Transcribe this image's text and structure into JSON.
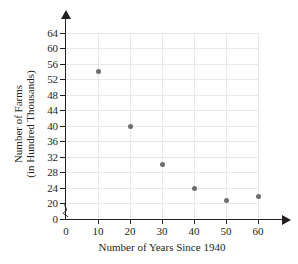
{
  "chart_data": {
    "type": "scatter",
    "title": "",
    "xlabel": "Number of Years Since 1940",
    "ylabel_line1": "Number of Farms",
    "ylabel_line2": "(in Hundred Thousands)",
    "x": [
      10,
      20,
      30,
      40,
      50,
      60
    ],
    "values": [
      54,
      39.8,
      30,
      23.8,
      20.7,
      21.7
    ],
    "points": [
      {
        "x": 10,
        "y": 54
      },
      {
        "x": 20,
        "y": 39.8
      },
      {
        "x": 30,
        "y": 30
      },
      {
        "x": 40,
        "y": 23.8
      },
      {
        "x": 50,
        "y": 20.7
      },
      {
        "x": 60,
        "y": 21.7
      }
    ],
    "xticks": [
      0,
      10,
      20,
      30,
      40,
      50,
      60
    ],
    "yticks": [
      0,
      20,
      24,
      28,
      32,
      36,
      40,
      44,
      48,
      52,
      56,
      60,
      64
    ],
    "xlim": [
      0,
      60
    ],
    "ylim": [
      20,
      64
    ],
    "y_axis_break": true,
    "y_axis_break_between": [
      0,
      20
    ],
    "grid": true,
    "legend": "none",
    "point_color": "#6d6e71",
    "grid_color": "#e8e8ea",
    "axis_color": "#231f20"
  }
}
